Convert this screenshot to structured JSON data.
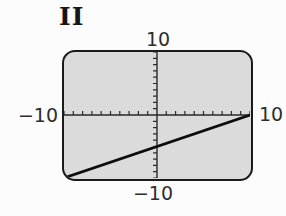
{
  "figure": {
    "label": "II"
  },
  "screen": {
    "bg_color": "#dbdbdb",
    "border_color": "#1b1b1b",
    "label_color": "#2d2d2d"
  },
  "window_labels": {
    "top": "10",
    "right": "10",
    "left": "−10",
    "bottom": "−10"
  },
  "chart_data": {
    "type": "line",
    "title": "",
    "xlabel": "",
    "ylabel": "",
    "xlim": [
      -10,
      10
    ],
    "ylim": [
      -10,
      10
    ],
    "xscl": 1,
    "yscl": 1,
    "grid": false,
    "legend": false,
    "axes_color": "#2a2a2a",
    "tick_color": "#2a2a2a",
    "tick_length_px": 4,
    "series": [
      {
        "name": "graphed-line",
        "color": "#0d0d0d",
        "points": [
          [
            -10,
            -10
          ],
          [
            10,
            0
          ]
        ]
      }
    ]
  }
}
